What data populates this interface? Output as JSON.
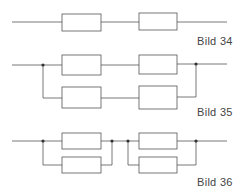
{
  "figures": [
    {
      "label": "Bild 34",
      "type": "two-blocks-series"
    },
    {
      "label": "Bild 35",
      "type": "two-series-strings-in-parallel"
    },
    {
      "label": "Bild 36",
      "type": "two-parallel-pairs-in-series"
    }
  ],
  "colors": {
    "stroke": "#555555",
    "background": "#ffffff"
  }
}
